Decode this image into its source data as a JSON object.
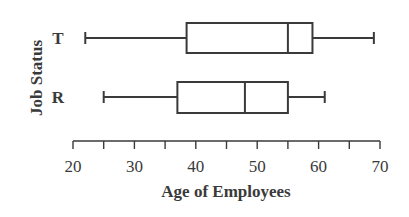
{
  "chart_data": {
    "type": "boxplot",
    "title": "",
    "xlabel": "Age of Employees",
    "ylabel": "Job Status",
    "xlim": [
      20,
      70
    ],
    "x_ticks_major": [
      20,
      30,
      40,
      50,
      60,
      70
    ],
    "x_ticks_minor": [
      25,
      35,
      45,
      55,
      65
    ],
    "grid": false,
    "categories": [
      "T",
      "R"
    ],
    "series": [
      {
        "name": "T",
        "min": 22,
        "q1": 38.5,
        "median": 55,
        "q3": 59,
        "max": 69
      },
      {
        "name": "R",
        "min": 25,
        "q1": 37,
        "median": 48,
        "q3": 55,
        "max": 61
      }
    ]
  },
  "colors": {
    "stroke": "#3a3a3a",
    "background": "#ffffff"
  }
}
